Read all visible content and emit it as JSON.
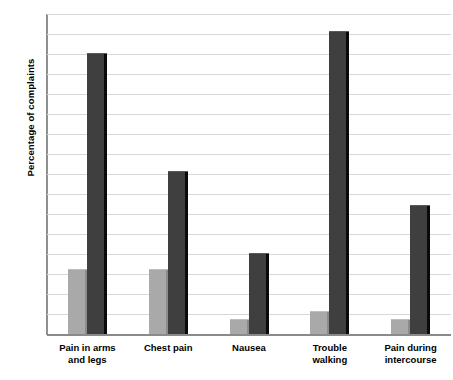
{
  "chart_data": {
    "type": "bar",
    "title": "",
    "subtitle": "",
    "xlabel": "",
    "ylabel": "Percentage of complaints",
    "ylim": [
      0,
      80
    ],
    "ytick_step": 5,
    "yticks": [
      "80",
      "75",
      "70",
      "65",
      "60",
      "55",
      "50",
      "45",
      "40",
      "35",
      "30",
      "25",
      "20",
      "15",
      "10",
      "5",
      "0"
    ],
    "grid": true,
    "legend": "none",
    "categories": [
      "Pain in arms and legs",
      "Chest pain",
      "Nausea",
      "Trouble walking",
      "Pain during intercourse"
    ],
    "category_lines": [
      [
        "Pain in arms",
        "and legs"
      ],
      [
        "Chest pain",
        ""
      ],
      [
        "Nausea",
        ""
      ],
      [
        "Trouble",
        "walking"
      ],
      [
        "Pain during",
        "intercourse"
      ]
    ],
    "series": [
      {
        "name": "light",
        "color": "#a9a9a9",
        "values": [
          16,
          16,
          3.5,
          5.5,
          3.5
        ]
      },
      {
        "name": "dark",
        "color": "#3f3f3f",
        "values": [
          70,
          40.5,
          20,
          75.5,
          32
        ]
      }
    ]
  },
  "colors": {
    "light_bar": "#a9a9a9",
    "dark_bar": "#3f3f3f",
    "bar_shadow": "#0a0a0a",
    "gridline": "#d8d8d8",
    "axis": "#8a8a8a",
    "text": "#000000",
    "background": "#ffffff"
  }
}
